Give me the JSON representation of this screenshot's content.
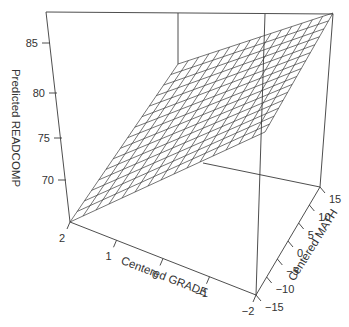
{
  "chart_data": {
    "type": "surface3d",
    "title": "",
    "xlabel": "Centered GRADE",
    "ylabel": "Centered MATH",
    "zlabel": "Predicted READCOMP",
    "x_ticks": [
      "2",
      "1",
      "0",
      "−1",
      "−2"
    ],
    "y_ticks": [
      "15",
      "10",
      "5",
      "0",
      "−5",
      "−10",
      "−15"
    ],
    "z_ticks": [
      "85",
      "80",
      "75",
      "70"
    ],
    "xlim": [
      -2,
      2
    ],
    "ylim": [
      -15,
      15
    ],
    "zlim": [
      66,
      88
    ],
    "grid_divisions": 15,
    "surface_corners": [
      {
        "grade": 2,
        "math": -15,
        "readcomp": 66.5
      },
      {
        "grade": 2,
        "math": 15,
        "readcomp": 78
      },
      {
        "grade": -2,
        "math": 15,
        "readcomp": 88
      },
      {
        "grade": -2,
        "math": -15,
        "readcomp": 76.5
      }
    ]
  },
  "colors": {
    "line": "#3a3a3a",
    "text": "#333333",
    "background": "#ffffff"
  },
  "labels": {
    "zlabel": "Predicted READCOMP",
    "xlabel": "Centered GRADE",
    "ylabel": "Centered MATH"
  }
}
